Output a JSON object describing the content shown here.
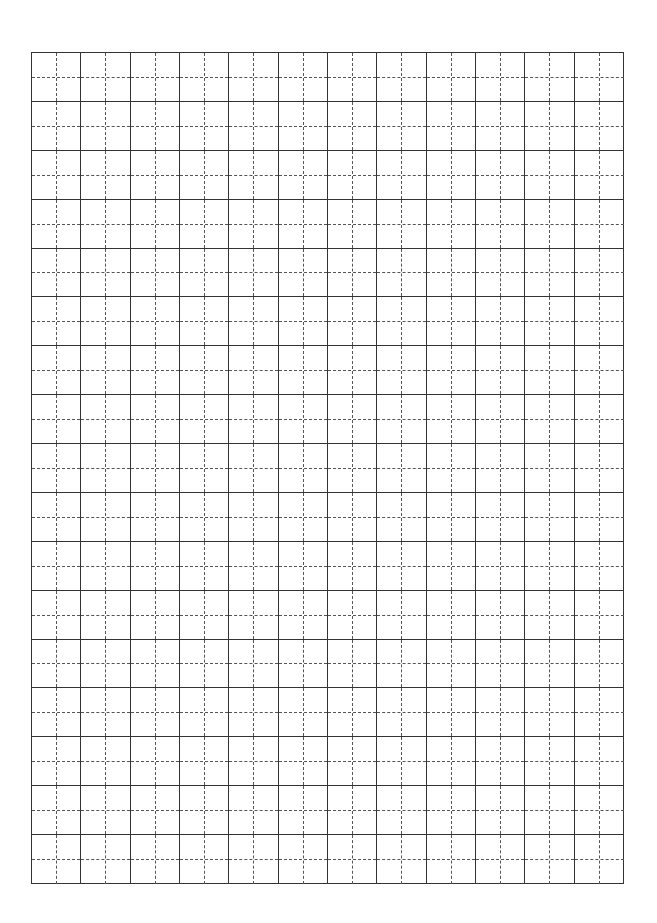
{
  "worksheet": {
    "type": "tianzige-grid",
    "columns": 12,
    "rows": 17,
    "cell_size_px": 49,
    "line_color": "#333333",
    "guide_color": "#555555",
    "guide_style": "dashed"
  }
}
